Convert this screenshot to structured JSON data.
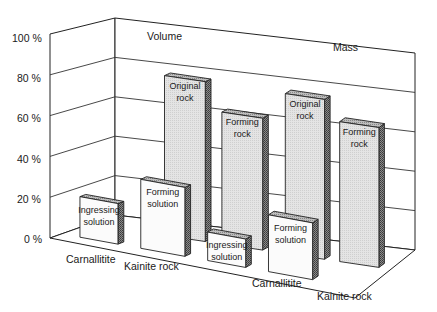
{
  "chart_data": {
    "type": "bar",
    "style": "3d-grouped-columns",
    "title": "",
    "panels": [
      {
        "title": "Volume",
        "categories": [
          "Carnallitite",
          "Kainite rock"
        ],
        "bars": [
          {
            "category": "Carnallitite",
            "position": "back",
            "label": "Original rock",
            "value": 80
          },
          {
            "category": "Kainite rock",
            "position": "back",
            "label": "Forming rock",
            "value": 66
          },
          {
            "category": "Carnallitite",
            "position": "front",
            "label": "Ingressing solution",
            "value": 20
          },
          {
            "category": "Kainite rock",
            "position": "front",
            "label": "Forming solution",
            "value": 34
          }
        ]
      },
      {
        "title": "Mass",
        "categories": [
          "Carnallitite",
          "Kainite rock"
        ],
        "bars": [
          {
            "category": "Carnallitite",
            "position": "back",
            "label": "Original rock",
            "value": 80
          },
          {
            "category": "Kainite rock",
            "position": "back",
            "label": "Forming rock",
            "value": 70
          },
          {
            "category": "Carnallitite",
            "position": "front",
            "label": "Ingressing solution",
            "value": 14
          },
          {
            "category": "Kainite rock",
            "position": "front",
            "label": "Forming solution",
            "value": 28
          }
        ]
      }
    ],
    "series": [
      {
        "name": "Original rock",
        "values": [
          80,
          80
        ]
      },
      {
        "name": "Forming rock",
        "values": [
          66,
          70
        ]
      },
      {
        "name": "Ingressing solution",
        "values": [
          20,
          14
        ]
      },
      {
        "name": "Forming solution",
        "values": [
          34,
          28
        ]
      }
    ],
    "x": [
      "Volume",
      "Mass"
    ],
    "xlabel": "",
    "ylabel": "",
    "yticks": [
      "0 %",
      "20 %",
      "40 %",
      "60 %",
      "80 %",
      "100 %"
    ],
    "ylim": [
      0,
      100
    ],
    "grid": true,
    "legend": "none (bars labeled directly)"
  },
  "labels": {
    "yticks": [
      "0 %",
      "20 %",
      "40 %",
      "60 %",
      "80 %",
      "100 %"
    ],
    "volume_title": "Volume",
    "mass_title": "Mass",
    "vol_cat1": "Carnallitite",
    "vol_cat2": "Kainite rock",
    "mass_cat1": "Carnallitite",
    "mass_cat2": "Kainite rock"
  },
  "colors": {
    "bar_front": "#e6e6e6",
    "bar_side": "#6e6e6e",
    "bar_top": "#a8a8a8",
    "solution_front": "#fafafa",
    "lines": "#222222"
  }
}
